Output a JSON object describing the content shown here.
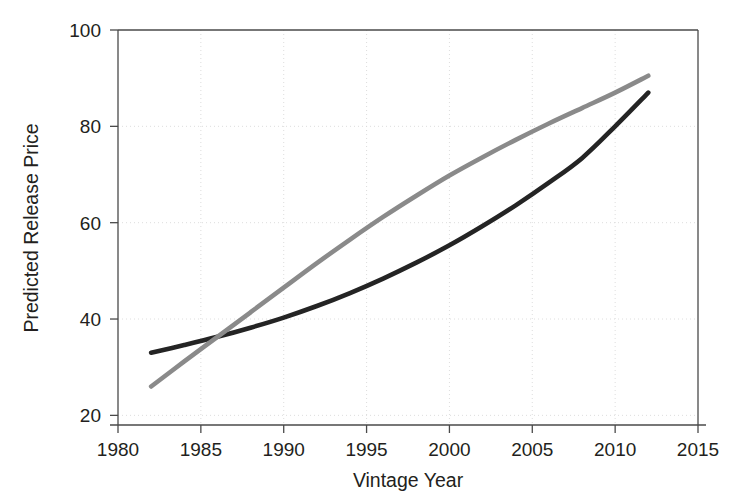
{
  "chart_data": {
    "type": "line",
    "title": "",
    "xlabel": "Vintage Year",
    "ylabel": "Predicted Release Price",
    "xlim": [
      1980,
      2015
    ],
    "ylim": [
      18,
      100
    ],
    "xticks": [
      1980,
      1985,
      1990,
      1995,
      2000,
      2005,
      2010,
      2015
    ],
    "xtick_labels": [
      "1980",
      "1985",
      "1990",
      "1995",
      "2000",
      "2005",
      "2010",
      "2015"
    ],
    "yticks": [
      20,
      40,
      60,
      80,
      100
    ],
    "ytick_labels": [
      "20",
      "40",
      "60",
      "80",
      "100"
    ],
    "grid": true,
    "legend": "none",
    "x": [
      1982,
      1984,
      1986,
      1988,
      1990,
      1992,
      1994,
      1996,
      1998,
      2000,
      2002,
      2004,
      2006,
      2008,
      2010,
      2012
    ],
    "series": [
      {
        "name": "dark-curve",
        "color": "#242424",
        "values": [
          33.0,
          34.6,
          36.3,
          38.2,
          40.3,
          42.7,
          45.4,
          48.4,
          51.7,
          55.3,
          59.3,
          63.6,
          68.3,
          73.4,
          80.0,
          87.0
        ]
      },
      {
        "name": "gray-curve",
        "color": "#8a8a8a",
        "values": [
          26.0,
          31.2,
          36.3,
          41.4,
          46.5,
          51.6,
          56.5,
          61.2,
          65.6,
          69.8,
          73.6,
          77.2,
          80.6,
          83.8,
          87.0,
          90.5
        ]
      }
    ],
    "crossing_point": {
      "x": 1985,
      "y": 36.0
    }
  },
  "axes": {
    "y_title": "Predicted Release Price",
    "x_title": "Vintage Year"
  },
  "colors": {
    "dark_series": "#242424",
    "gray_series": "#8a8a8a",
    "axis": "#4a4a4a",
    "grid": "#d9d9d9",
    "background": "#ffffff"
  }
}
